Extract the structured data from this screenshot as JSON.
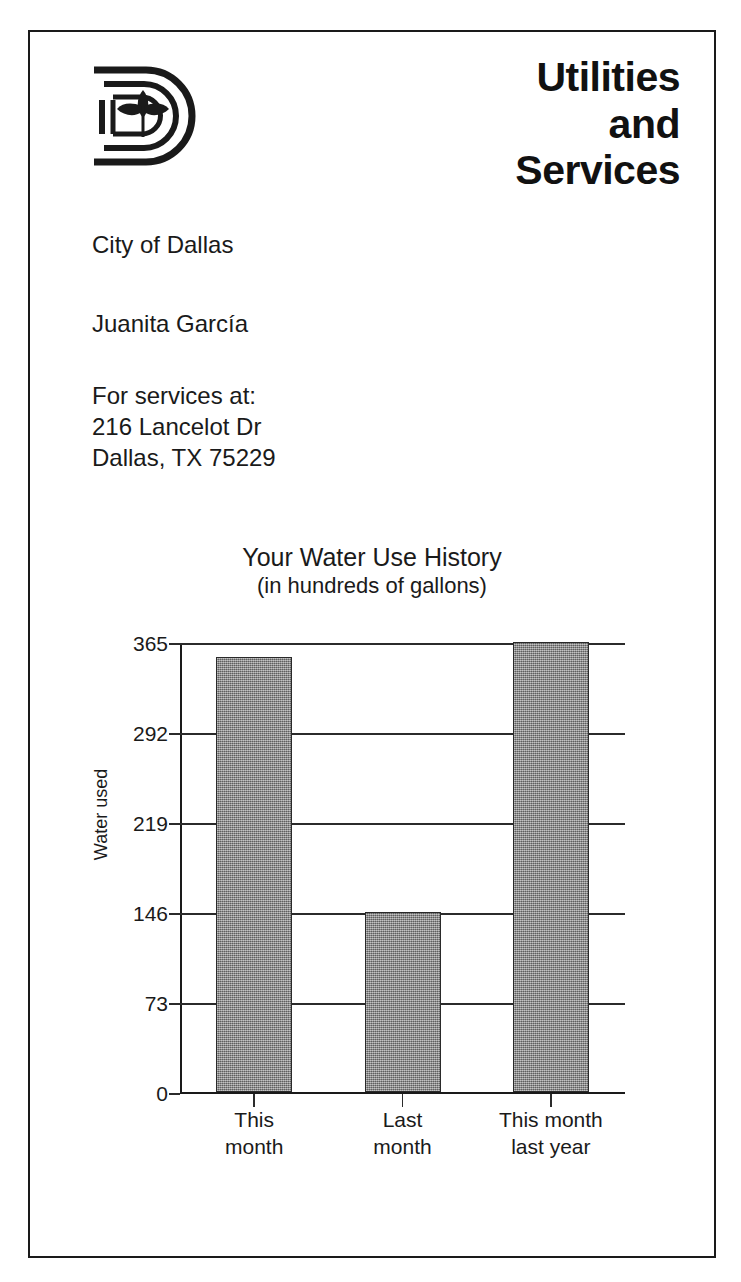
{
  "document": {
    "logo_name": "city-of-dallas-d-logo",
    "department_title_lines": [
      "Utilities",
      "and",
      "Services"
    ],
    "city": "City of Dallas",
    "customer_name": "Juanita García",
    "service_label": "For services at:",
    "service_address_line1": "216 Lancelot Dr",
    "service_address_line2": "Dallas, TX 75229"
  },
  "colors": {
    "ink": "#1a1a1a",
    "bar_fill": "#8a8a8a",
    "bar_stroke": "#2a2a2a",
    "paper": "#ffffff",
    "border": "#1a1a1a"
  },
  "chart_data": {
    "type": "bar",
    "title": "Your Water Use History",
    "subtitle": "(in hundreds of gallons)",
    "xlabel": "",
    "ylabel": "Water used",
    "categories": [
      "This month",
      "Last month",
      "This month last year"
    ],
    "category_label_lines": [
      [
        "This",
        "month"
      ],
      [
        "Last",
        "month"
      ],
      [
        "This month",
        "last year"
      ]
    ],
    "values": [
      353,
      146,
      365
    ],
    "ylim": [
      0,
      365
    ],
    "yticks": [
      0,
      73,
      146,
      219,
      292,
      365
    ],
    "ytick_labels": [
      "0",
      "73",
      "146",
      "219",
      "292",
      "365"
    ],
    "grid": true,
    "legend": "none"
  }
}
